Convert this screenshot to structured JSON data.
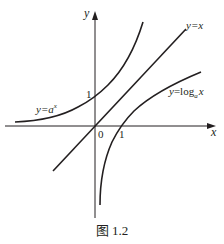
{
  "figure": {
    "caption": "图 1.2",
    "axes": {
      "x_label": "x",
      "y_label": "y",
      "origin_label": "0",
      "x_tick_label": "1",
      "y_tick_label": "1"
    },
    "curves": [
      {
        "name": "exponential",
        "label_prefix": "y=a",
        "label_sup": "x",
        "label": "y=a^x"
      },
      {
        "name": "identity",
        "label": "y=x"
      },
      {
        "name": "logarithm",
        "label_prefix": "y=log",
        "label_sub": "a",
        "label_suffix": "x",
        "label": "y=log_a x"
      }
    ],
    "colors": {
      "stroke": "#231f20",
      "background": "#ffffff"
    }
  }
}
